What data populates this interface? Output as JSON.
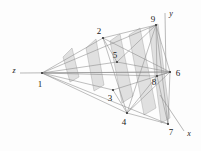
{
  "figure": {
    "background_color": "#fdfdfd",
    "line_color": "#8a8a8a",
    "dark_line_color": "#6e6e6e",
    "fill_color": "#c9c9c9",
    "fill_opacity": "0.55",
    "text_color": "#1a1a1a"
  },
  "axes": [
    {
      "name": "z",
      "label": "z",
      "x": 13,
      "y": 71,
      "tip_x": 22,
      "tip_y": 73
    },
    {
      "name": "y",
      "label": "y",
      "x": 170,
      "y": 14,
      "tip_x": 165,
      "tip_y": 13
    },
    {
      "name": "x",
      "label": "x",
      "x": 188,
      "y": 134,
      "tip_x": 182,
      "tip_y": 130
    }
  ],
  "nodes": [
    {
      "id": "1",
      "label": "1",
      "px": 42,
      "py": 73,
      "lx": 40,
      "ly": 84
    },
    {
      "id": "2",
      "label": "2",
      "px": 103,
      "py": 38,
      "lx": 99,
      "ly": 36
    },
    {
      "id": "3",
      "label": "3",
      "px": 113,
      "py": 90,
      "lx": 110,
      "ly": 99
    },
    {
      "id": "4",
      "label": "4",
      "px": 127,
      "py": 113,
      "lx": 124,
      "ly": 122
    },
    {
      "id": "5",
      "label": "5",
      "px": 117,
      "py": 62,
      "lx": 114,
      "ly": 60
    },
    {
      "id": "6",
      "label": "6",
      "px": 170,
      "py": 72,
      "lx": 176,
      "ly": 75
    },
    {
      "id": "7",
      "label": "7",
      "px": 168,
      "py": 124,
      "lx": 171,
      "ly": 133
    },
    {
      "id": "8",
      "label": "8",
      "px": 157,
      "py": 76,
      "lx": 154,
      "ly": 83
    },
    {
      "id": "9",
      "label": "9",
      "px": 156,
      "py": 25,
      "lx": 153,
      "ly": 23
    }
  ],
  "edges": [
    {
      "from": "1",
      "to": "2"
    },
    {
      "from": "1",
      "to": "3"
    },
    {
      "from": "1",
      "to": "4"
    },
    {
      "from": "1",
      "to": "5"
    },
    {
      "from": "1",
      "to": "6"
    },
    {
      "from": "1",
      "to": "7"
    },
    {
      "from": "1",
      "to": "8"
    },
    {
      "from": "1",
      "to": "9"
    },
    {
      "from": "2",
      "to": "9"
    },
    {
      "from": "2",
      "to": "5"
    },
    {
      "from": "2",
      "to": "4"
    },
    {
      "from": "2",
      "to": "6"
    },
    {
      "from": "3",
      "to": "4"
    },
    {
      "from": "3",
      "to": "6"
    },
    {
      "from": "4",
      "to": "7"
    },
    {
      "from": "4",
      "to": "9"
    },
    {
      "from": "4",
      "to": "6"
    },
    {
      "from": "5",
      "to": "6"
    },
    {
      "from": "5",
      "to": "9"
    },
    {
      "from": "6",
      "to": "7"
    },
    {
      "from": "6",
      "to": "9"
    },
    {
      "from": "7",
      "to": "9"
    },
    {
      "from": "8",
      "to": "6"
    },
    {
      "from": "8",
      "to": "9"
    },
    {
      "from": "8",
      "to": "7"
    },
    {
      "from": "8",
      "to": "4"
    }
  ],
  "fins": [
    {
      "name": "fin-a",
      "points": "63,57 72,48 79,77 70,82"
    },
    {
      "name": "fin-b",
      "points": "86,48 96,39 104,85 94,91"
    },
    {
      "name": "fin-c",
      "points": "110,41 120,34 133,96 122,103"
    },
    {
      "name": "fin-d",
      "points": "129,35 140,28 156,108 144,115"
    },
    {
      "name": "fin-e",
      "points": "149,28 158,24 170,118 161,123"
    }
  ],
  "fan_lines_upper": [
    {
      "x1": 42,
      "y1": 73,
      "x2": 103,
      "y2": 38
    },
    {
      "x1": 42,
      "y1": 73,
      "x2": 117,
      "y2": 62
    },
    {
      "x1": 42,
      "y1": 73,
      "x2": 156,
      "y2": 25
    },
    {
      "x1": 42,
      "y1": 73,
      "x2": 170,
      "y2": 72
    }
  ],
  "fan_lines_lower": [
    {
      "x1": 42,
      "y1": 73,
      "x2": 113,
      "y2": 90
    },
    {
      "x1": 42,
      "y1": 73,
      "x2": 127,
      "y2": 113
    },
    {
      "x1": 42,
      "y1": 73,
      "x2": 168,
      "y2": 124
    },
    {
      "x1": 42,
      "y1": 73,
      "x2": 157,
      "y2": 76
    }
  ]
}
